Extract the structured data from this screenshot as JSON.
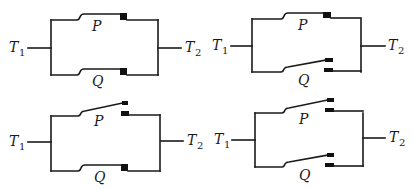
{
  "figure": {
    "colors": {
      "ink": "#1a1a1a",
      "contact": "#111111",
      "background": "#ffffff"
    },
    "circuits": [
      {
        "id": "circuit-1",
        "position": "top-left",
        "terminal_left": {
          "label": "T",
          "sub": "1"
        },
        "terminal_right": {
          "label": "T",
          "sub": "2"
        },
        "switch_upper": {
          "label": "P",
          "state": "closed"
        },
        "switch_lower": {
          "label": "Q",
          "state": "closed"
        }
      },
      {
        "id": "circuit-2",
        "position": "top-right",
        "terminal_left": {
          "label": "T",
          "sub": "1"
        },
        "terminal_right": {
          "label": "T",
          "sub": "2"
        },
        "switch_upper": {
          "label": "P",
          "state": "closed"
        },
        "switch_lower": {
          "label": "Q",
          "state": "open"
        }
      },
      {
        "id": "circuit-3",
        "position": "bottom-left",
        "terminal_left": {
          "label": "T",
          "sub": "1"
        },
        "terminal_right": {
          "label": "T",
          "sub": "2"
        },
        "switch_upper": {
          "label": "P",
          "state": "open"
        },
        "switch_lower": {
          "label": "Q",
          "state": "closed"
        }
      },
      {
        "id": "circuit-4",
        "position": "bottom-right",
        "terminal_left": {
          "label": "T",
          "sub": "1"
        },
        "terminal_right": {
          "label": "T",
          "sub": "2"
        },
        "switch_upper": {
          "label": "P",
          "state": "open"
        },
        "switch_lower": {
          "label": "Q",
          "state": "open"
        }
      }
    ]
  }
}
